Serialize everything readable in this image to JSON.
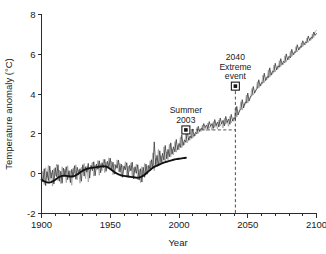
{
  "chart_data": {
    "type": "line",
    "title": "",
    "xlabel": "Year",
    "ylabel": "Temperature anomaly (°C)",
    "xlim": [
      1900,
      2100
    ],
    "ylim": [
      -2,
      8
    ],
    "xticks": [
      1900,
      1950,
      2000,
      2050,
      2100
    ],
    "xtick_labels": [
      "1900",
      "1950",
      "2000",
      "2050",
      "2100"
    ],
    "xminor_step": 10,
    "yticks": [
      -2,
      0,
      2,
      4,
      6,
      8
    ],
    "ytick_labels": [
      "-2",
      "0",
      "2",
      "4",
      "6",
      "8"
    ],
    "grid": false,
    "legend": "none",
    "series": [
      {
        "name": "observed-simulated-ensemble-light",
        "color": "#9a9a9a",
        "width": 0.75,
        "x_start": 1900,
        "x_end": 2100,
        "values": [
          -0.28,
          0.12,
          -0.55,
          0.3,
          -0.18,
          0.42,
          -0.4,
          0.05,
          -0.62,
          0.25,
          -0.1,
          0.48,
          -0.35,
          0.18,
          -0.5,
          0.35,
          -0.05,
          0.22,
          -0.45,
          0.4,
          -0.2,
          0.15,
          -0.58,
          0.28,
          0.02,
          0.45,
          -0.3,
          0.2,
          -0.48,
          0.33,
          0.08,
          0.52,
          -0.25,
          0.38,
          -0.42,
          0.18,
          0.3,
          0.58,
          -0.12,
          0.45,
          0.22,
          0.66,
          -0.08,
          0.5,
          0.15,
          0.72,
          0.05,
          0.6,
          0.28,
          0.8,
          0.18,
          0.62,
          -0.05,
          0.48,
          0.25,
          0.7,
          0.1,
          0.52,
          -0.15,
          0.42,
          0.18,
          0.6,
          -0.1,
          0.38,
          0.12,
          0.55,
          -0.22,
          0.3,
          0.05,
          0.48,
          -0.3,
          0.22,
          -0.45,
          0.35,
          -0.15,
          0.52,
          -0.05,
          0.4,
          0.18,
          0.65,
          0.3,
          1.05,
          0.15,
          0.78,
          0.35,
          1.22,
          0.42,
          0.9,
          0.55,
          1.35,
          0.6,
          1.1,
          0.7,
          1.48,
          0.85,
          1.25,
          0.95,
          1.62,
          1.08,
          1.42,
          1.2,
          1.85,
          1.3,
          1.6,
          1.45,
          2.05,
          1.55,
          1.8,
          1.68,
          2.18,
          1.78,
          2.0,
          1.9,
          2.32,
          2.02,
          2.2,
          2.12,
          2.45,
          2.22,
          2.35,
          2.15,
          2.55,
          2.28,
          2.42,
          2.18,
          2.62,
          2.32,
          2.5,
          2.25,
          2.7,
          2.4,
          2.58,
          2.3,
          2.78,
          2.48,
          2.65,
          2.38,
          2.88,
          2.55,
          2.72,
          2.62,
          3.25,
          2.85,
          3.05,
          3.1,
          3.62,
          3.2,
          3.48,
          3.45,
          3.95,
          3.55,
          3.78,
          3.82,
          4.28,
          3.95,
          4.12,
          4.18,
          4.62,
          4.3,
          4.48,
          4.45,
          4.95,
          4.58,
          4.78,
          4.72,
          5.22,
          4.85,
          5.05,
          5.0,
          5.45,
          5.12,
          5.32,
          5.25,
          5.68,
          5.38,
          5.55,
          5.48,
          5.92,
          5.62,
          5.8,
          5.72,
          6.15,
          5.88,
          6.02,
          6.0,
          6.38,
          6.12,
          6.28,
          6.25,
          6.58,
          6.38,
          6.52,
          6.48,
          6.82,
          6.6,
          6.75,
          6.7,
          7.02,
          6.85,
          7.15,
          7.2
        ]
      },
      {
        "name": "observed-simulated-ensemble-dark",
        "color": "#3a3a3a",
        "width": 0.8,
        "x_start": 1900,
        "x_end": 2100,
        "values": [
          -0.05,
          -0.42,
          0.25,
          -0.6,
          0.1,
          -0.35,
          0.38,
          -0.22,
          0.18,
          -0.52,
          0.3,
          -0.15,
          0.45,
          -0.38,
          0.12,
          -0.48,
          0.28,
          -0.08,
          0.35,
          -0.3,
          0.15,
          -0.45,
          0.22,
          -0.18,
          0.4,
          -0.28,
          0.32,
          -0.05,
          0.25,
          -0.38,
          0.45,
          -0.12,
          0.35,
          0.08,
          0.52,
          -0.22,
          0.42,
          0.15,
          0.6,
          -0.1,
          0.48,
          0.22,
          0.65,
          0.05,
          0.55,
          0.3,
          0.72,
          0.12,
          0.62,
          0.35,
          0.78,
          0.18,
          0.58,
          -0.02,
          0.45,
          0.28,
          0.68,
          0.08,
          0.48,
          -0.18,
          0.38,
          0.2,
          0.55,
          -0.12,
          0.42,
          0.15,
          0.58,
          -0.25,
          0.35,
          0.02,
          0.45,
          -0.32,
          0.25,
          -0.42,
          0.32,
          -0.18,
          0.48,
          -0.02,
          0.42,
          0.22,
          0.7,
          0.28,
          1.6,
          0.45,
          0.92,
          0.38,
          1.15,
          0.55,
          1.02,
          0.68,
          1.42,
          0.75,
          1.22,
          0.85,
          1.55,
          0.98,
          1.35,
          1.1,
          1.72,
          1.2,
          1.52,
          1.32,
          1.95,
          1.42,
          1.7,
          1.58,
          2.12,
          1.68,
          1.9,
          1.78,
          2.25,
          1.88,
          2.08,
          2.0,
          2.38,
          2.12,
          2.28,
          2.22,
          2.52,
          2.32,
          2.45,
          2.25,
          2.62,
          2.38,
          2.52,
          2.28,
          2.72,
          2.42,
          2.6,
          2.35,
          2.8,
          2.5,
          2.68,
          2.4,
          2.88,
          2.58,
          2.75,
          2.48,
          2.98,
          2.65,
          2.82,
          2.72,
          3.38,
          2.95,
          3.18,
          3.22,
          3.72,
          3.3,
          3.58,
          3.55,
          4.05,
          3.65,
          3.88,
          3.92,
          4.38,
          4.05,
          4.22,
          4.28,
          4.72,
          4.4,
          4.58,
          4.55,
          5.05,
          4.68,
          4.88,
          4.82,
          5.32,
          4.95,
          5.15,
          5.1,
          5.55,
          5.22,
          5.42,
          5.35,
          5.78,
          5.48,
          5.65,
          5.58,
          6.02,
          5.72,
          5.9,
          5.82,
          6.25,
          5.98,
          6.12,
          6.1,
          6.48,
          6.22,
          6.38,
          6.35,
          6.68,
          6.48,
          6.62,
          6.58,
          6.92,
          6.7,
          6.85,
          6.8,
          7.12,
          6.95,
          7.05
        ]
      },
      {
        "name": "smoothed-trend-historical",
        "color": "#101010",
        "width": 1.9,
        "x_start": 1900,
        "x_end": 2005,
        "values": [
          -0.3,
          -0.34,
          -0.38,
          -0.41,
          -0.43,
          -0.44,
          -0.44,
          -0.42,
          -0.39,
          -0.35,
          -0.3,
          -0.25,
          -0.2,
          -0.16,
          -0.13,
          -0.11,
          -0.1,
          -0.1,
          -0.11,
          -0.12,
          -0.13,
          -0.14,
          -0.14,
          -0.13,
          -0.11,
          -0.08,
          -0.04,
          0.01,
          0.06,
          0.11,
          0.15,
          0.19,
          0.22,
          0.24,
          0.26,
          0.28,
          0.29,
          0.3,
          0.31,
          0.32,
          0.33,
          0.34,
          0.35,
          0.36,
          0.37,
          0.38,
          0.37,
          0.36,
          0.33,
          0.29,
          0.24,
          0.19,
          0.14,
          0.09,
          0.04,
          0.0,
          -0.03,
          -0.06,
          -0.08,
          -0.1,
          -0.11,
          -0.12,
          -0.13,
          -0.14,
          -0.15,
          -0.16,
          -0.17,
          -0.18,
          -0.19,
          -0.2,
          -0.2,
          -0.19,
          -0.17,
          -0.14,
          -0.1,
          -0.05,
          0.01,
          0.07,
          0.13,
          0.19,
          0.25,
          0.3,
          0.34,
          0.38,
          0.41,
          0.44,
          0.47,
          0.5,
          0.53,
          0.56,
          0.58,
          0.6,
          0.62,
          0.64,
          0.66,
          0.68,
          0.7,
          0.72,
          0.73,
          0.74,
          0.75,
          0.76,
          0.77,
          0.78,
          0.79,
          0.8
        ]
      }
    ],
    "annotations": [
      {
        "id": "summer-2003",
        "lines": [
          "Summer",
          "2003"
        ],
        "text": "Summer 2003",
        "x": 2005,
        "y": 2.2,
        "marker": "filled-square-outlined",
        "leader": "dashed-horizontal-to-2040"
      },
      {
        "id": "extreme-2040",
        "lines": [
          "2040",
          "Extreme",
          "event"
        ],
        "text": "2040 Extreme event",
        "x": 2041,
        "y": 4.4,
        "marker": "filled-square-outlined",
        "leader": "dashed-vertical-to-axis"
      }
    ]
  },
  "axes": {
    "x_title": "Year",
    "y_title": "Temperature anomaly (°C)"
  },
  "colors": {
    "background": "#ffffff",
    "axis": "#2b2b2b",
    "series_light": "#9a9a9a",
    "series_dark": "#3a3a3a",
    "trend": "#101010",
    "annotation": "#1a1a1a"
  }
}
